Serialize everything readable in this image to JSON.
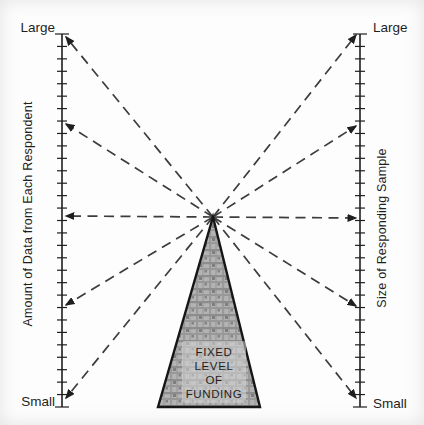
{
  "figure": {
    "left_axis": {
      "title": "Amount of Data from Each Respondent",
      "top_label": "Large",
      "bottom_label": "Small"
    },
    "right_axis": {
      "title": "Size of Responding Sample",
      "top_label": "Large",
      "bottom_label": "Small"
    },
    "funding_triangle": {
      "label_lines": [
        "FIXED",
        "LEVEL",
        "OF",
        "FUNDING"
      ]
    },
    "arrows": {
      "apex": [
        213,
        217
      ],
      "left_targets_y": [
        37,
        124,
        216,
        305,
        398
      ],
      "right_targets_y": [
        35,
        126,
        218,
        306,
        398
      ]
    },
    "colors": {
      "ink": "#1f1f1f",
      "dash": "#3c3c3c",
      "triangle_fill": "#b3b3b3",
      "triangle_outline": "#161616",
      "background": "#fdfdfd"
    }
  }
}
